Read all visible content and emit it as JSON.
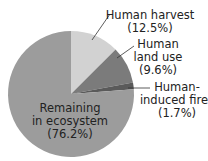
{
  "chart_data": {
    "type": "pie",
    "title": "",
    "categories": [
      "Human harvest",
      "Human land use",
      "Human-induced fires",
      "Remaining in ecosystem"
    ],
    "values": [
      12.5,
      9.6,
      1.7,
      76.2
    ],
    "unit": "%",
    "start_angle": "12 o'clock",
    "direction": "clockwise",
    "colors": [
      "#d2d2d2",
      "#7b7b7b",
      "#5a5a5a",
      "#9c9c9c"
    ],
    "legend": "none (direct labels with leader lines)"
  },
  "labels": {
    "harvest": {
      "line1": "Human harvest",
      "line2": "(12.5%)"
    },
    "landuse": {
      "line1": "Human",
      "line2": "land use",
      "line3": "(9.6%)"
    },
    "fires": {
      "line1": "Human-",
      "line2": "induced fires",
      "line3": "(1.7%)"
    },
    "remaining": {
      "line1": "Remaining",
      "line2": "in ecosystem",
      "line3": "(76.2%)"
    }
  }
}
